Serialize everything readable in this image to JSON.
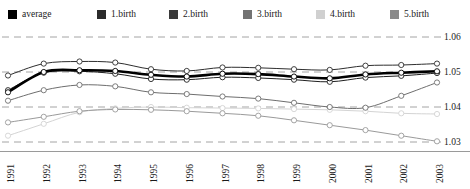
{
  "legend": {
    "items": [
      {
        "label": "average",
        "color": "#000000",
        "x": 8
      },
      {
        "label": "1.birth",
        "color": "#2b2b2b",
        "x": 97
      },
      {
        "label": "2.birth",
        "color": "#3a3a3a",
        "x": 169
      },
      {
        "label": "3.birth",
        "color": "#737373",
        "x": 243
      },
      {
        "label": "4.birth",
        "color": "#d0d0d0",
        "x": 316
      },
      {
        "label": "5.birth",
        "color": "#8a8a8a",
        "x": 390
      }
    ]
  },
  "yaxis": {
    "ticks": [
      "1.06",
      "1.05",
      "1.04",
      "1.03"
    ],
    "values": [
      1.06,
      1.05,
      1.04,
      1.03
    ]
  },
  "xaxis": {
    "ticks": [
      "1991",
      "1992",
      "1993",
      "1994",
      "1995",
      "1996",
      "1997",
      "1998",
      "1999",
      "2000",
      "2001",
      "2002",
      "2003"
    ]
  },
  "chart_data": {
    "type": "line",
    "title": "",
    "xlabel": "",
    "ylabel": "",
    "grid": true,
    "legend_position": "top",
    "ylim": [
      1.025,
      1.063
    ],
    "yticks": [
      1.03,
      1.04,
      1.05,
      1.06
    ],
    "x": [
      "1991",
      "1992",
      "1993",
      "1994",
      "1995",
      "1996",
      "1997",
      "1998",
      "1999",
      "2000",
      "2001",
      "2002",
      "2003"
    ],
    "marker": "open-circle",
    "series": [
      {
        "name": "average",
        "color": "#000000",
        "width": 2.6,
        "values": [
          1.0442,
          1.05,
          1.0505,
          1.0503,
          1.0492,
          1.0487,
          1.0495,
          1.0494,
          1.0487,
          1.0482,
          1.0493,
          1.0498,
          1.0502
        ]
      },
      {
        "name": "1.birth",
        "color": "#1f1f1f",
        "width": 1.0,
        "values": [
          1.0448,
          1.0498,
          1.0502,
          1.0495,
          1.048,
          1.0478,
          1.0485,
          1.0483,
          1.0478,
          1.0472,
          1.0484,
          1.0489,
          1.0497
        ]
      },
      {
        "name": "2.birth",
        "color": "#2e2e2e",
        "width": 1.0,
        "values": [
          1.049,
          1.0524,
          1.053,
          1.0527,
          1.0508,
          1.0503,
          1.0513,
          1.0512,
          1.0508,
          1.0506,
          1.0518,
          1.052,
          1.0524
        ]
      },
      {
        "name": "3.birth",
        "color": "#6e6e6e",
        "width": 1.0,
        "values": [
          1.0418,
          1.0448,
          1.0463,
          1.0459,
          1.0442,
          1.0437,
          1.043,
          1.0424,
          1.0412,
          1.04,
          1.0398,
          1.0432,
          1.047
        ]
      },
      {
        "name": "4.birth",
        "color": "#d4d4d4",
        "width": 1.0,
        "values": [
          1.0318,
          1.0352,
          1.0385,
          1.0396,
          1.04,
          1.0398,
          1.0397,
          1.0396,
          1.0394,
          1.0392,
          1.0388,
          1.0382,
          1.038
        ]
      },
      {
        "name": "5.birth",
        "color": "#9a9a9a",
        "width": 1.0,
        "values": [
          1.0356,
          1.0372,
          1.0388,
          1.0393,
          1.0392,
          1.0388,
          1.0382,
          1.0375,
          1.0362,
          1.0348,
          1.0334,
          1.0318,
          1.0302
        ]
      }
    ]
  }
}
